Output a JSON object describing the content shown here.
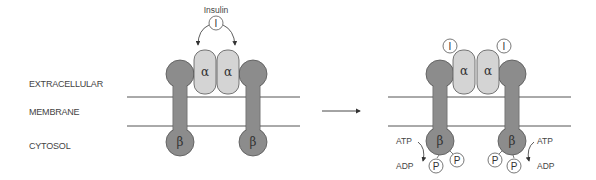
{
  "diagram": {
    "region_labels": {
      "extracellular": "EXTRACELLULAR",
      "membrane": "MEMBRANE",
      "cytosol": "CYTOSOL"
    },
    "ligand_label": "Insulin",
    "ligand_symbol": "I",
    "alpha_symbol": "α",
    "beta_symbol": "β",
    "phosphate_symbol": "P",
    "atp_label": "ATP",
    "adp_label": "ADP",
    "colors": {
      "beta_subunit": "#8c8c8c",
      "alpha_subunit": "#d4d4d4",
      "outline": "#555555",
      "membrane_line": "#555555"
    },
    "panels": [
      {
        "state": "inactive",
        "insulin_bound": false,
        "phosphorylated": false
      },
      {
        "state": "active",
        "insulin_bound": true,
        "phosphorylated": true
      }
    ]
  }
}
